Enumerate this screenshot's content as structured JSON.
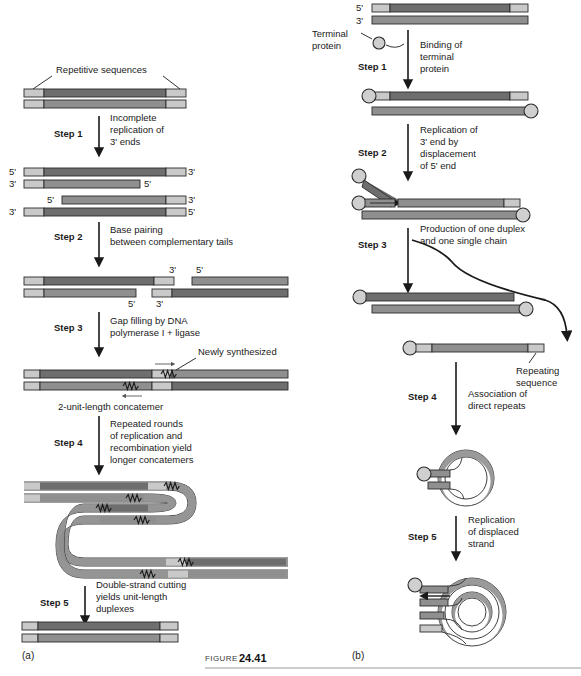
{
  "figure": {
    "caption_word": "FIGURE",
    "caption_number": "24.41",
    "panel_a_label": "(a)",
    "panel_b_label": "(b)"
  },
  "colors": {
    "dark_strand": "#6e6e6e",
    "mid_strand": "#8f8f8f",
    "light_repeat": "#c9c9c9",
    "outline": "#2b2b2b",
    "protein_fill": "#cfcfcf",
    "text": "#1a1a1a",
    "background": "#ffffff"
  },
  "panel_a": {
    "label": "(a)",
    "top_annotation": "Repetitive sequences",
    "steps": [
      {
        "name": "Step 1",
        "description": "Incomplete\nreplication of\n3' ends",
        "lines": [
          "Incomplete",
          "replication of",
          "3' ends"
        ]
      },
      {
        "name": "Step 2",
        "description": "Base pairing\nbetween complementary tails",
        "lines": [
          "Base pairing",
          "between complementary tails"
        ]
      },
      {
        "name": "Step 3",
        "description": "Gap filling by DNA\npolymerase I + ligase",
        "lines": [
          "Gap filling by DNA",
          "polymerase I + ligase"
        ]
      },
      {
        "name": "Step 4",
        "description": "Repeated rounds\nof replication and\nrecombination yield\nlonger concatemers",
        "lines": [
          "Repeated rounds",
          "of replication and",
          "recombination yield",
          "longer concatemers"
        ]
      },
      {
        "name": "Step 5",
        "description": "Double-strand cutting\nyields unit-length\nduplexes",
        "lines": [
          "Double-strand cutting",
          "yields unit-length",
          "duplexes"
        ]
      }
    ],
    "annotations": [
      {
        "name": "newly-synthesized",
        "text": "Newly synthesized"
      },
      {
        "name": "concatemer",
        "text": "2-unit-length concatemer"
      }
    ],
    "end_labels": {
      "five_prime": "5'",
      "three_prime": "3'"
    }
  },
  "panel_b": {
    "label": "(b)",
    "steps": [
      {
        "name": "Step 1",
        "description": "Binding of\nterminal protein",
        "lines": [
          "Binding of",
          "terminal",
          "protein"
        ]
      },
      {
        "name": "Step 2",
        "description": "Replication of 3' end by displacement of 5' end",
        "lines": [
          "Replication of",
          "3' end by",
          "displacement",
          "of 5' end"
        ]
      },
      {
        "name": "Step 3",
        "description": "Production of one duplex and one single chain",
        "lines": [
          "Production of one duplex",
          "and one single chain"
        ]
      },
      {
        "name": "Step 4",
        "description": "Association of direct repeats",
        "lines": [
          "Association of",
          "direct repeats"
        ]
      },
      {
        "name": "Step 5",
        "description": "Replication of displaced strand",
        "lines": [
          "Replication",
          "of displaced",
          "strand"
        ]
      }
    ],
    "annotations": [
      {
        "name": "terminal-protein",
        "lines": [
          "Terminal",
          "protein"
        ]
      },
      {
        "name": "repeating-sequence",
        "lines": [
          "Repeating",
          "sequence"
        ]
      }
    ],
    "end_labels": {
      "five_prime": "5'",
      "three_prime": "3'"
    }
  }
}
